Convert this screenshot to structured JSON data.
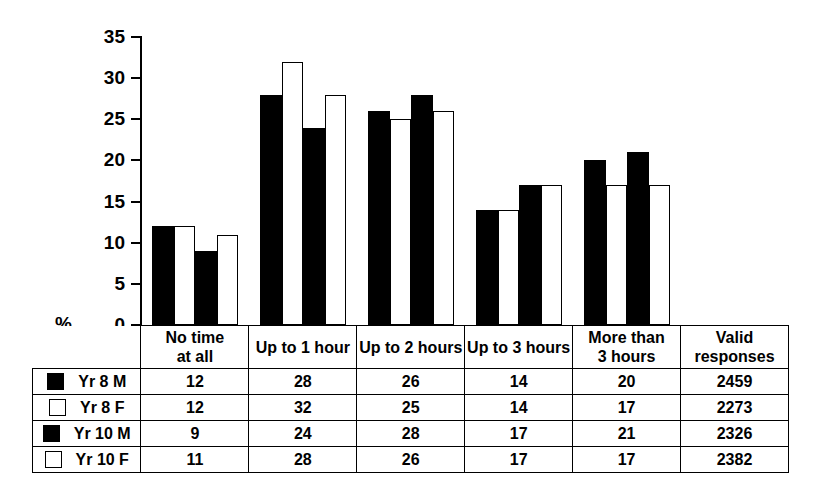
{
  "chart_data": {
    "type": "bar",
    "title": "",
    "xlabel": "",
    "ylabel": "%",
    "ylim": [
      0,
      35
    ],
    "ytick_step": 5,
    "yticks": [
      35,
      30,
      25,
      20,
      15,
      10,
      5,
      0
    ],
    "grid": false,
    "legend_position": "table-left",
    "categories": [
      "No time at all",
      "Up to 1 hour",
      "Up to 2 hours",
      "Up to 3 hours",
      "More than 3 hours"
    ],
    "series": [
      {
        "name": "Yr 8 M",
        "fill": "black",
        "values": [
          12,
          28,
          26,
          14,
          20
        ],
        "valid_responses": 2459
      },
      {
        "name": "Yr 8 F",
        "fill": "white",
        "values": [
          12,
          32,
          25,
          14,
          17
        ],
        "valid_responses": 2273
      },
      {
        "name": "Yr 10 M",
        "fill": "black",
        "values": [
          9,
          24,
          28,
          17,
          21
        ],
        "valid_responses": 2326
      },
      {
        "name": "Yr 10 F",
        "fill": "white",
        "values": [
          11,
          28,
          26,
          17,
          17
        ],
        "valid_responses": 2382
      }
    ]
  },
  "axis": {
    "y_label": "%",
    "ticks": [
      "35",
      "30",
      "25",
      "20",
      "15",
      "10",
      "5",
      "0"
    ]
  },
  "table": {
    "column_headers": [
      {
        "line1": "No time",
        "line2": "at all"
      },
      {
        "line1": "Up to 1 hour",
        "line2": ""
      },
      {
        "line1": "Up to 2 hours",
        "line2": ""
      },
      {
        "line1": "Up to 3 hours",
        "line2": ""
      },
      {
        "line1": "More than",
        "line2": "3 hours"
      },
      {
        "line1": "Valid",
        "line2": "responses"
      }
    ],
    "rows": [
      {
        "swatch": "black",
        "label": "Yr 8 M",
        "cells": [
          "12",
          "28",
          "26",
          "14",
          "20",
          "2459"
        ]
      },
      {
        "swatch": "white",
        "label": "Yr 8 F",
        "cells": [
          "12",
          "32",
          "25",
          "14",
          "17",
          "2273"
        ]
      },
      {
        "swatch": "black",
        "label": "Yr 10 M",
        "cells": [
          "9",
          "24",
          "28",
          "17",
          "21",
          "2326"
        ]
      },
      {
        "swatch": "white",
        "label": "Yr 10 F",
        "cells": [
          "11",
          "28",
          "26",
          "17",
          "17",
          "2382"
        ]
      }
    ]
  },
  "colors": {
    "series_black": "#000000",
    "series_white": "#ffffff",
    "stroke": "#000000",
    "background": "#ffffff"
  }
}
